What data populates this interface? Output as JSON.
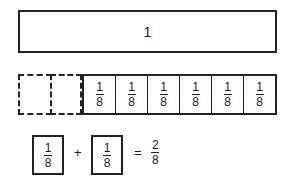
{
  "whole": {
    "label": "1"
  },
  "strip": {
    "empty_dashed_slots": 2,
    "cells": [
      {
        "num": "1",
        "den": "8"
      },
      {
        "num": "1",
        "den": "8"
      },
      {
        "num": "1",
        "den": "8"
      },
      {
        "num": "1",
        "den": "8"
      },
      {
        "num": "1",
        "den": "8"
      },
      {
        "num": "1",
        "den": "8"
      }
    ]
  },
  "equation": {
    "term1": {
      "num": "1",
      "den": "8"
    },
    "plus": "+",
    "term2": {
      "num": "1",
      "den": "8"
    },
    "equals": "=",
    "result": {
      "num": "2",
      "den": "8"
    }
  }
}
